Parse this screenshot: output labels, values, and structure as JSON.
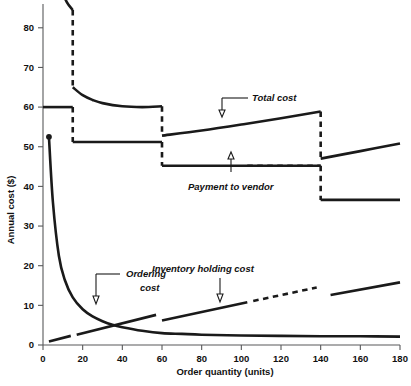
{
  "chart_data": {
    "type": "line",
    "title": "",
    "xlabel": "Order quantity (units)",
    "ylabel": "Annual cost ($)",
    "xlim": [
      0,
      180
    ],
    "ylim": [
      0,
      86
    ],
    "xticks": [
      0,
      20,
      40,
      60,
      80,
      100,
      120,
      140,
      160,
      180
    ],
    "yticks": [
      0,
      10,
      20,
      30,
      40,
      50,
      60,
      70,
      80
    ],
    "grid": false,
    "legend": "annotations-inline",
    "price_breaks": [
      15,
      60,
      140
    ],
    "series": [
      {
        "name": "Total cost",
        "style": "stepped-discontinuous",
        "segments": [
          {
            "x": [
              3,
              6,
              9,
              12,
              15
            ],
            "y": [
              115.5,
              97.0,
              90.0,
              86.5,
              84.5
            ]
          },
          {
            "x": [
              15,
              20,
              25,
              30,
              40,
              50,
              60
            ],
            "y": [
              65.0,
              63.0,
              61.8,
              61.0,
              60.2,
              60.0,
              60.2
            ]
          },
          {
            "x": [
              60,
              80,
              100,
              120,
              140
            ],
            "y": [
              52.8,
              54.1,
              55.6,
              57.2,
              58.9
            ]
          },
          {
            "x": [
              140,
              160,
              180
            ],
            "y": [
              47.0,
              48.9,
              50.8
            ]
          }
        ]
      },
      {
        "name": "Payment to vendor",
        "style": "step",
        "levels": [
          {
            "x_from": 0,
            "x_to": 15,
            "y": 60.0
          },
          {
            "x_from": 15,
            "x_to": 60,
            "y": 51.2
          },
          {
            "x_from": 60,
            "x_to": 140,
            "y": 45.2
          },
          {
            "x_from": 140,
            "x_to": 180,
            "y": 36.6
          }
        ]
      },
      {
        "name": "Ordering cost",
        "style": "hyperbolic",
        "start_point": {
          "x": 3,
          "y": 52.5
        },
        "x": [
          3,
          5,
          8,
          11,
          15,
          20,
          25,
          30,
          35,
          40,
          50,
          60,
          70,
          80,
          100,
          120,
          140,
          160,
          180
        ],
        "y": [
          52.5,
          36.0,
          22.5,
          16.4,
          12.0,
          9.0,
          7.2,
          6.0,
          5.1,
          4.5,
          3.6,
          3.0,
          2.8,
          2.6,
          2.4,
          2.3,
          2.2,
          2.2,
          2.1
        ]
      },
      {
        "name": "Inventory holding cost",
        "style": "linear-with-gaps",
        "segments": [
          {
            "x": [
              3,
              14
            ],
            "y": [
              0.9,
              2.3
            ]
          },
          {
            "x": [
              17,
              57
            ],
            "y": [
              2.6,
              7.6
            ]
          },
          {
            "x": [
              60,
              103
            ],
            "y": [
              6.2,
              10.8
            ]
          },
          {
            "x": [
              106,
              138
            ],
            "y": [
              11.1,
              14.5
            ]
          },
          {
            "x": [
              145,
              180
            ],
            "y": [
              12.6,
              15.8
            ]
          }
        ]
      }
    ],
    "annotations": [
      {
        "name": "total-cost",
        "text": "Total cost",
        "target": {
          "x": 78,
          "y": 54.6
        }
      },
      {
        "name": "payment-to-vendor",
        "text": "Payment to vendor",
        "target": {
          "x": 92,
          "y": 45.2
        }
      },
      {
        "name": "ordering-cost",
        "text_line1": "Ordering",
        "text_line2": "cost",
        "target": {
          "x": 26,
          "y": 10.2
        }
      },
      {
        "name": "inventory-holding-cost",
        "text": "Inventory holding cost",
        "target": {
          "x": 74,
          "y": 8.9
        }
      }
    ]
  },
  "axes": {
    "y_title": "Annual cost ($)",
    "x_title": "Order quantity (units)",
    "x_tick_labels": [
      "0",
      "20",
      "40",
      "60",
      "80",
      "100",
      "120",
      "140",
      "160",
      "180"
    ],
    "y_tick_labels": [
      "0",
      "10",
      "20",
      "30",
      "40",
      "50",
      "60",
      "70",
      "80"
    ]
  },
  "annotations": {
    "total_cost": "Total cost",
    "payment_to_vendor": "Payment to vendor",
    "ordering_cost_l1": "Ordering",
    "ordering_cost_l2": "cost",
    "inventory_holding_cost": "Inventory holding cost"
  },
  "colors": {
    "curve": "#1a1a1a",
    "axis": "#58595b",
    "background": "#ffffff"
  }
}
